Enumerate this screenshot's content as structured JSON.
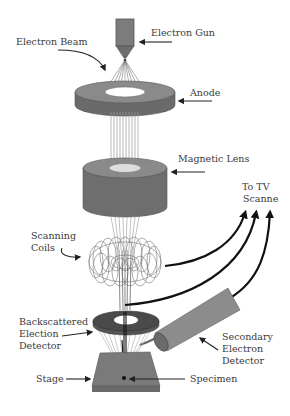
{
  "diagram": {
    "labels": {
      "electron_gun": "Electron Gun",
      "electron_beam": "Electron Beam",
      "anode": "Anode",
      "magnetic_lens": "Magnetic Lens",
      "to_tv_line1": "To TV",
      "to_tv_line2": "Scanne",
      "scanning_coils_line1": "Scanning",
      "scanning_coils_line2": "Coils",
      "backscattered_line1": "Backscattered",
      "backscattered_line2": "Election",
      "backscattered_line3": "Detector",
      "secondary_line1": "Secondary",
      "secondary_line2": "Electron",
      "secondary_line3": "Detector",
      "stage": "Stage",
      "specimen": "Specimen"
    },
    "colors": {
      "component_fill": "#7a7a7a",
      "component_dark": "#5a5a5a",
      "beam_line": "#8a8a8a",
      "arrow": "#111111",
      "text": "#3a3a3a",
      "background": "#ffffff"
    }
  }
}
